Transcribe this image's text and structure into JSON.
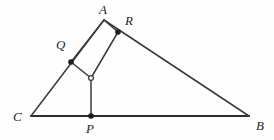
{
  "figure": {
    "kind": "geometry-diagram",
    "width": 274,
    "height": 140,
    "background_color": "#fefefe",
    "stroke_color": "#3a3a3a",
    "base_stroke_color": "#2e2e2e",
    "marker_fill_color": "#1c1c1c",
    "open_marker_fill_color": "#fefefe",
    "label_color": "#262626"
  },
  "points": {
    "A": {
      "label": "A",
      "x": 104,
      "y": 20,
      "label_x": 99,
      "label_y": 3,
      "marker": "none"
    },
    "B": {
      "label": "B",
      "x": 249,
      "y": 116,
      "label_x": 256,
      "label_y": 119,
      "marker": "none"
    },
    "C": {
      "label": "C",
      "x": 31,
      "y": 116,
      "label_x": 13,
      "label_y": 110,
      "marker": "none"
    },
    "P": {
      "label": "P",
      "x": 91,
      "y": 116,
      "label_x": 86,
      "label_y": 122,
      "marker": "filled"
    },
    "Q": {
      "label": "Q",
      "x": 71,
      "y": 62,
      "label_x": 56,
      "label_y": 38,
      "marker": "filled"
    },
    "R": {
      "label": "R",
      "x": 118,
      "y": 32,
      "label_x": 125,
      "label_y": 14,
      "marker": "filled"
    },
    "O": {
      "label": "",
      "x": 91,
      "y": 78,
      "label_x": 0,
      "label_y": 0,
      "marker": "open"
    }
  },
  "segments": [
    {
      "name": "side-CB",
      "from": "C",
      "to": "B",
      "width": 2.2,
      "color": "#2e2e2e"
    },
    {
      "name": "side-CA",
      "from": "C",
      "to": "A",
      "width": 1.5,
      "color": "#3a3a3a"
    },
    {
      "name": "side-AB",
      "from": "A",
      "to": "B",
      "width": 1.5,
      "color": "#3a3a3a"
    },
    {
      "name": "segment-AQ-side",
      "from": "A",
      "to": "Q",
      "width": 1.5,
      "color": "#3a3a3a"
    },
    {
      "name": "segment-AR",
      "from": "A",
      "to": "R",
      "width": 1.5,
      "color": "#3a3a3a"
    },
    {
      "name": "segment-RO",
      "from": "R",
      "to": "O",
      "width": 1.5,
      "color": "#3a3a3a"
    },
    {
      "name": "segment-OQ",
      "from": "O",
      "to": "Q",
      "width": 1.5,
      "color": "#3a3a3a"
    },
    {
      "name": "segment-OP",
      "from": "O",
      "to": "P",
      "width": 1.5,
      "color": "#3a3a3a"
    }
  ],
  "markers": [
    {
      "name": "point-marker-Q",
      "point": "Q",
      "type": "filled",
      "radius": 2.8
    },
    {
      "name": "point-marker-R",
      "point": "R",
      "type": "filled",
      "radius": 2.8
    },
    {
      "name": "point-marker-P",
      "point": "P",
      "type": "filled",
      "radius": 2.8
    },
    {
      "name": "point-marker-O",
      "point": "O",
      "type": "open",
      "radius": 2.4
    }
  ],
  "labels": [
    {
      "name": "vertex-label-A",
      "key": "A"
    },
    {
      "name": "vertex-label-B",
      "key": "B"
    },
    {
      "name": "vertex-label-C",
      "key": "C"
    },
    {
      "name": "vertex-label-P",
      "key": "P"
    },
    {
      "name": "vertex-label-Q",
      "key": "Q"
    },
    {
      "name": "vertex-label-R",
      "key": "R"
    }
  ]
}
